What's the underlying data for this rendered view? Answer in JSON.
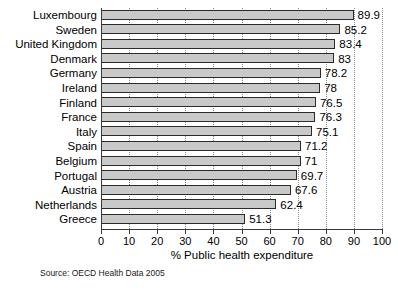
{
  "chart_data": {
    "type": "bar",
    "orientation": "horizontal",
    "title": "",
    "xlabel": "% Public health expenditure",
    "ylabel": "",
    "xlim": [
      0,
      100
    ],
    "xticks": [
      0,
      10,
      20,
      30,
      40,
      50,
      60,
      70,
      80,
      90,
      100
    ],
    "grid": "vertical-dotted",
    "legend": "none",
    "categories": [
      "Luxembourg",
      "Sweden",
      "United Kingdom",
      "Denmark",
      "Germany",
      "Ireland",
      "Finland",
      "France",
      "Italy",
      "Spain",
      "Belgium",
      "Portugal",
      "Austria",
      "Netherlands",
      "Greece"
    ],
    "values": [
      89.9,
      85.2,
      83.4,
      83,
      78.2,
      78,
      76.5,
      76.3,
      75.1,
      71.2,
      71,
      69.7,
      67.6,
      62.4,
      51.3
    ],
    "value_labels": [
      "89.9",
      "85.2",
      "83.4",
      "83",
      "78.2",
      "78",
      "76.5",
      "76.3",
      "75.1",
      "71.2",
      "71",
      "69.7",
      "67.6",
      "62.4",
      "51.3"
    ],
    "annotations": [
      "Source: OECD Health Data 2005"
    ]
  },
  "source": {
    "text": "Source: OECD Health Data 2005"
  },
  "colors": {
    "bar_fill": "#c9c9c9",
    "bar_border": "#2b2b2b",
    "axis": "#3a3a3a",
    "grid": "#8c8c8c",
    "background": "#ffffff",
    "text": "#000000"
  }
}
